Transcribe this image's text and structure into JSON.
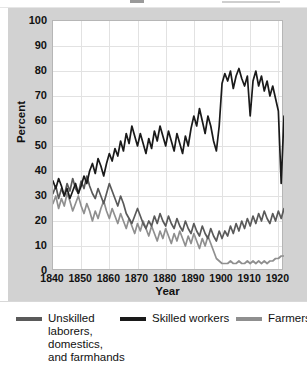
{
  "figure": {
    "background": "#ffffff",
    "panel_color": "#d2d2d2",
    "plot_background": "#ffffff"
  },
  "axes": {
    "ylabel": "Percent",
    "xlabel": "Year",
    "yticks": [
      "100",
      "90",
      "80",
      "70",
      "60",
      "50",
      "40",
      "30",
      "20",
      "10",
      "0"
    ],
    "xticks": [
      "1840",
      "1850",
      "1860",
      "1870",
      "1880",
      "1890",
      "1900",
      "1910",
      "1920"
    ]
  },
  "legend": {
    "unskilled_label": "Unskilled\nlaborers,\ndomestics,\nand farmhands",
    "skilled_label": "Skilled workers",
    "farmers_label": "Farmers",
    "unskilled_color": "#5a5a5a",
    "skilled_color": "#1a1a1a",
    "farmers_color": "#8f8f8f"
  },
  "chart_data": {
    "type": "line",
    "title": "",
    "xlabel": "Year",
    "ylabel": "Percent",
    "xlim": [
      1840,
      1922
    ],
    "ylim": [
      0,
      100
    ],
    "grid": true,
    "legend_position": "below",
    "x": [
      1840,
      1841,
      1842,
      1843,
      1844,
      1845,
      1846,
      1847,
      1848,
      1849,
      1850,
      1851,
      1852,
      1853,
      1854,
      1855,
      1856,
      1857,
      1858,
      1859,
      1860,
      1861,
      1862,
      1863,
      1864,
      1865,
      1866,
      1867,
      1868,
      1869,
      1870,
      1871,
      1872,
      1873,
      1874,
      1875,
      1876,
      1877,
      1878,
      1879,
      1880,
      1881,
      1882,
      1883,
      1884,
      1885,
      1886,
      1887,
      1888,
      1889,
      1890,
      1891,
      1892,
      1893,
      1894,
      1895,
      1896,
      1897,
      1898,
      1899,
      1900,
      1901,
      1902,
      1903,
      1904,
      1905,
      1906,
      1907,
      1908,
      1909,
      1910,
      1911,
      1912,
      1913,
      1914,
      1915,
      1916,
      1917,
      1918,
      1919,
      1920,
      1921,
      1922
    ],
    "series": [
      {
        "name": "Unskilled laborers, domestics, and farmhands",
        "color": "#5a5a5a",
        "values": [
          31,
          34,
          29,
          33,
          30,
          35,
          32,
          37,
          33,
          31,
          36,
          33,
          38,
          34,
          31,
          29,
          33,
          30,
          27,
          31,
          35,
          32,
          29,
          26,
          30,
          27,
          23,
          21,
          19,
          22,
          25,
          22,
          19,
          17,
          20,
          18,
          22,
          19,
          23,
          20,
          18,
          22,
          19,
          17,
          21,
          18,
          16,
          20,
          17,
          15,
          19,
          16,
          14,
          18,
          15,
          13,
          17,
          14,
          12,
          16,
          13,
          16,
          14,
          18,
          15,
          19,
          16,
          20,
          17,
          21,
          18,
          22,
          19,
          23,
          20,
          24,
          21,
          19,
          23,
          20,
          24,
          21,
          25
        ]
      },
      {
        "name": "Skilled workers",
        "color": "#1a1a1a",
        "values": [
          36,
          33,
          37,
          34,
          30,
          33,
          29,
          32,
          35,
          31,
          34,
          38,
          35,
          40,
          43,
          39,
          45,
          42,
          38,
          43,
          47,
          44,
          49,
          46,
          52,
          48,
          55,
          51,
          58,
          54,
          50,
          55,
          51,
          47,
          53,
          49,
          56,
          52,
          58,
          54,
          50,
          56,
          52,
          48,
          55,
          51,
          47,
          54,
          50,
          57,
          62,
          58,
          65,
          60,
          55,
          62,
          58,
          52,
          48,
          58,
          75,
          79,
          76,
          80,
          73,
          78,
          81,
          77,
          74,
          78,
          62,
          76,
          80,
          74,
          78,
          72,
          76,
          70,
          74,
          69,
          64,
          35,
          62
        ]
      },
      {
        "name": "Farmers",
        "color": "#8f8f8f",
        "values": [
          27,
          30,
          25,
          29,
          26,
          31,
          28,
          24,
          27,
          30,
          26,
          23,
          27,
          24,
          20,
          24,
          21,
          25,
          28,
          24,
          21,
          25,
          22,
          19,
          23,
          20,
          17,
          21,
          18,
          15,
          19,
          16,
          20,
          17,
          14,
          18,
          15,
          12,
          16,
          13,
          17,
          14,
          11,
          15,
          12,
          16,
          13,
          10,
          14,
          11,
          15,
          12,
          9,
          13,
          10,
          14,
          11,
          8,
          5,
          4,
          3,
          3,
          3,
          4,
          3,
          3,
          4,
          3,
          3,
          4,
          3,
          4,
          3,
          4,
          3,
          4,
          3,
          4,
          4,
          5,
          5,
          6,
          6
        ]
      }
    ]
  }
}
